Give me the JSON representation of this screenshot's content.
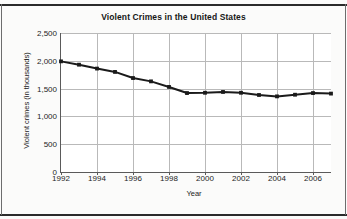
{
  "chart_data": {
    "type": "line",
    "title": "Violent Crimes in the United States",
    "xlabel": "Year",
    "ylabel": "Violent crimes (in thousands)",
    "xlim": [
      1992,
      2007
    ],
    "ylim": [
      0,
      2500
    ],
    "grid": true,
    "legend": "none",
    "marker": "square",
    "line_color": "#1a1a1a",
    "gridline_color": "#b9b9b9",
    "x_tick_labels": [
      "1992",
      "1994",
      "1996",
      "1998",
      "2000",
      "2002",
      "2004",
      "2006"
    ],
    "x_ticks": [
      1992,
      1994,
      1996,
      1998,
      2000,
      2002,
      2004,
      2006
    ],
    "y_tick_labels": [
      "0",
      "500",
      "1,000",
      "1,500",
      "2,000",
      "2,500"
    ],
    "y_ticks": [
      0,
      500,
      1000,
      1500,
      2000,
      2500
    ],
    "x": [
      1992,
      1993,
      1994,
      1995,
      1996,
      1997,
      1998,
      1999,
      2000,
      2001,
      2002,
      2003,
      2004,
      2005,
      2006,
      2007
    ],
    "values": [
      1990,
      1930,
      1860,
      1800,
      1690,
      1630,
      1530,
      1420,
      1425,
      1440,
      1425,
      1385,
      1360,
      1390,
      1420,
      1410
    ],
    "series": [
      {
        "name": "Violent crimes",
        "values": [
          1990,
          1930,
          1860,
          1800,
          1690,
          1630,
          1530,
          1420,
          1425,
          1440,
          1425,
          1385,
          1360,
          1390,
          1420,
          1410
        ]
      }
    ]
  }
}
